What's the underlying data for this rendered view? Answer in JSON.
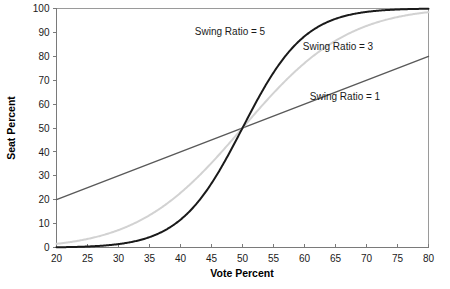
{
  "chart_data": {
    "type": "line",
    "title": "",
    "xlabel": "Vote Percent",
    "ylabel": "Seat Percent",
    "xlim": [
      20,
      80
    ],
    "ylim": [
      0,
      100
    ],
    "xticks": [
      20,
      25,
      30,
      35,
      40,
      45,
      50,
      55,
      60,
      65,
      70,
      75,
      80
    ],
    "yticks": [
      0,
      10,
      20,
      30,
      40,
      50,
      60,
      70,
      80,
      90,
      100
    ],
    "grid": false,
    "legend_position": "inline-annotations",
    "x": [
      20,
      22,
      24,
      26,
      28,
      30,
      32,
      34,
      36,
      38,
      40,
      42,
      44,
      46,
      48,
      50,
      52,
      54,
      56,
      58,
      60,
      62,
      64,
      66,
      68,
      70,
      72,
      74,
      76,
      78,
      80
    ],
    "series": [
      {
        "name": "Swing Ratio = 1",
        "color": "#595959",
        "linewidth": 1.4,
        "annotation": "Swing Ratio = 1",
        "values": [
          20,
          22,
          24,
          26,
          28,
          30,
          32,
          34,
          36,
          38,
          40,
          42,
          44,
          46,
          48,
          50,
          52,
          54,
          56,
          58,
          60,
          62,
          64,
          66,
          68,
          70,
          72,
          74,
          76,
          78,
          80
        ]
      },
      {
        "name": "Swing Ratio = 3",
        "color": "#d2d2d2",
        "linewidth": 2.0,
        "annotation": "Swing Ratio = 3",
        "values": [
          1.5,
          2.0,
          2.6,
          3.4,
          4.3,
          5.4,
          6.8,
          8.4,
          10.2,
          12.4,
          14.8,
          17.6,
          20.7,
          24.1,
          27.9,
          50.0,
          56.4,
          62.5,
          68.2,
          73.3,
          77.9,
          81.8,
          85.2,
          88.0,
          90.4,
          92.3,
          93.9,
          95.2,
          96.2,
          97.0,
          97.7
        ]
      },
      {
        "name": "Swing Ratio = 5",
        "color": "#1a1a1a",
        "linewidth": 2.0,
        "annotation": "Swing Ratio = 5",
        "values": [
          0.1,
          0.14,
          0.22,
          0.33,
          0.48,
          0.69,
          0.98,
          1.37,
          1.9,
          2.6,
          3.5,
          4.7,
          6.3,
          8.3,
          10.9,
          50.0,
          61.5,
          71.4,
          79.4,
          85.4,
          89.9,
          93.1,
          95.4,
          96.9,
          98.0,
          98.7,
          99.2,
          99.5,
          99.7,
          99.8,
          99.9
        ]
      }
    ],
    "annotations": [
      {
        "text": "Swing Ratio = 5",
        "x_px": 230,
        "y_px": 35
      },
      {
        "text": "Swing Ratio = 3",
        "x_px": 338,
        "y_px": 50
      },
      {
        "text": "Swing Ratio = 1",
        "x_px": 345,
        "y_px": 100
      }
    ]
  }
}
